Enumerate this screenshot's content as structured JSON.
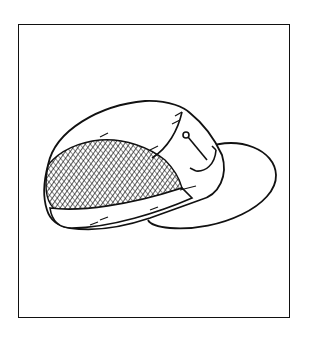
{
  "illustration": {
    "subject": "cap-with-anchor-emblem",
    "style": "black and white line drawing",
    "colors": {
      "ink": "#111111",
      "paper": "#ffffff"
    }
  }
}
